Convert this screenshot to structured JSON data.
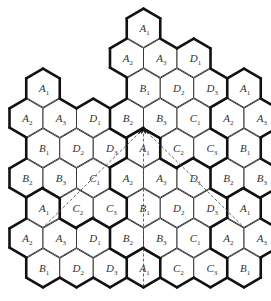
{
  "diagram": {
    "title": "",
    "rows": [
      [
        {
          "col": 8,
          "letter": "A",
          "sub": "1"
        }
      ],
      [
        {
          "col": 7,
          "letter": "A",
          "sub": "2"
        },
        {
          "col": 9,
          "letter": "A",
          "sub": "3"
        },
        {
          "col": 11,
          "letter": "D",
          "sub": "1"
        }
      ],
      [
        {
          "col": 2,
          "letter": "A",
          "sub": "1"
        },
        {
          "col": 8,
          "letter": "B",
          "sub": "1"
        },
        {
          "col": 10,
          "letter": "D",
          "sub": "2"
        },
        {
          "col": 12,
          "letter": "D",
          "sub": "3"
        },
        {
          "col": 14,
          "letter": "A",
          "sub": "1"
        }
      ],
      [
        {
          "col": 1,
          "letter": "A",
          "sub": "2"
        },
        {
          "col": 3,
          "letter": "A",
          "sub": "3"
        },
        {
          "col": 5,
          "letter": "D",
          "sub": "1"
        },
        {
          "col": 7,
          "letter": "B",
          "sub": "2"
        },
        {
          "col": 9,
          "letter": "B",
          "sub": "3"
        },
        {
          "col": 11,
          "letter": "C",
          "sub": "1"
        },
        {
          "col": 13,
          "letter": "A",
          "sub": "2"
        },
        {
          "col": 15,
          "letter": "A",
          "sub": "3"
        }
      ],
      [
        {
          "col": 2,
          "letter": "B",
          "sub": "1"
        },
        {
          "col": 4,
          "letter": "D",
          "sub": "2"
        },
        {
          "col": 6,
          "letter": "D",
          "sub": "3"
        },
        {
          "col": 8,
          "letter": "A",
          "sub": "1"
        },
        {
          "col": 10,
          "letter": "C",
          "sub": "2"
        },
        {
          "col": 12,
          "letter": "C",
          "sub": "3"
        },
        {
          "col": 14,
          "letter": "B",
          "sub": "1"
        }
      ],
      [
        {
          "col": 1,
          "letter": "B",
          "sub": "2"
        },
        {
          "col": 3,
          "letter": "B",
          "sub": "3"
        },
        {
          "col": 5,
          "letter": "C",
          "sub": "1"
        },
        {
          "col": 7,
          "letter": "A",
          "sub": "2"
        },
        {
          "col": 9,
          "letter": "A",
          "sub": "3"
        },
        {
          "col": 11,
          "letter": "D",
          "sub": "1"
        },
        {
          "col": 13,
          "letter": "B",
          "sub": "2"
        },
        {
          "col": 15,
          "letter": "B",
          "sub": "3"
        }
      ],
      [
        {
          "col": 2,
          "letter": "A",
          "sub": "1"
        },
        {
          "col": 4,
          "letter": "C",
          "sub": "2"
        },
        {
          "col": 6,
          "letter": "C",
          "sub": "3"
        },
        {
          "col": 8,
          "letter": "B",
          "sub": "1"
        },
        {
          "col": 10,
          "letter": "D",
          "sub": "2"
        },
        {
          "col": 12,
          "letter": "D",
          "sub": "3"
        },
        {
          "col": 14,
          "letter": "A",
          "sub": "1"
        }
      ],
      [
        {
          "col": 1,
          "letter": "A",
          "sub": "2"
        },
        {
          "col": 3,
          "letter": "A",
          "sub": "3"
        },
        {
          "col": 5,
          "letter": "D",
          "sub": "1"
        },
        {
          "col": 7,
          "letter": "B",
          "sub": "2"
        },
        {
          "col": 9,
          "letter": "B",
          "sub": "3"
        },
        {
          "col": 11,
          "letter": "C",
          "sub": "1"
        },
        {
          "col": 13,
          "letter": "A",
          "sub": "2"
        },
        {
          "col": 15,
          "letter": "A",
          "sub": "3"
        }
      ],
      [
        {
          "col": 2,
          "letter": "B",
          "sub": "1"
        },
        {
          "col": 4,
          "letter": "D",
          "sub": "2"
        },
        {
          "col": 6,
          "letter": "D",
          "sub": "3"
        },
        {
          "col": 8,
          "letter": "A",
          "sub": "1"
        },
        {
          "col": 10,
          "letter": "C",
          "sub": "2"
        },
        {
          "col": 12,
          "letter": "C",
          "sub": "3"
        },
        {
          "col": 14,
          "letter": "B",
          "sub": "1"
        }
      ]
    ],
    "dashed_lines": [
      {
        "from": {
          "row": 4,
          "col": 8,
          "vertex": "top"
        },
        "to": {
          "row": 6,
          "col": 2,
          "vertex": "bottom"
        }
      },
      {
        "from": {
          "row": 4,
          "col": 8,
          "vertex": "top"
        },
        "to": {
          "row": 8,
          "col": 8,
          "vertex": "bottom"
        }
      },
      {
        "from": {
          "row": 4,
          "col": 8,
          "vertex": "top"
        },
        "to": {
          "row": 6,
          "col": 14,
          "vertex": "bottom"
        }
      }
    ],
    "apex_marker": "arrowheads"
  }
}
